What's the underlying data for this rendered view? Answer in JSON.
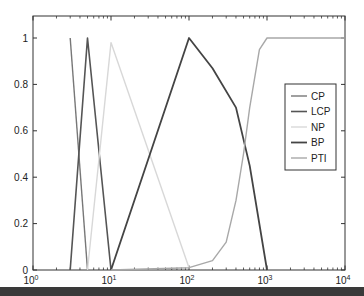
{
  "chart_data": {
    "type": "line",
    "title": "",
    "xlabel": "",
    "ylabel": "",
    "xscale": "log",
    "xlim": [
      1,
      10000
    ],
    "ylim": [
      0,
      1.05
    ],
    "grid": false,
    "legend_position": "right-middle",
    "x_ticks": [
      {
        "exp": 0,
        "label": "10",
        "sup": "0"
      },
      {
        "exp": 1,
        "label": "10",
        "sup": "1"
      },
      {
        "exp": 2,
        "label": "10",
        "sup": "2"
      },
      {
        "exp": 3,
        "label": "10",
        "sup": "3"
      },
      {
        "exp": 4,
        "label": "10",
        "sup": "4"
      }
    ],
    "y_ticks": [
      {
        "value": 0,
        "label": "0"
      },
      {
        "value": 0.2,
        "label": "0.2"
      },
      {
        "value": 0.4,
        "label": "0.4"
      },
      {
        "value": 0.6,
        "label": "0.6"
      },
      {
        "value": 0.8,
        "label": "0.8"
      },
      {
        "value": 1,
        "label": "1"
      }
    ],
    "series": [
      {
        "name": "CP",
        "color": "#777777",
        "width": 1.4,
        "points": [
          [
            3,
            1
          ],
          [
            5,
            0
          ]
        ]
      },
      {
        "name": "LCP",
        "color": "#555555",
        "width": 1.6,
        "points": [
          [
            3,
            0
          ],
          [
            5,
            1
          ],
          [
            10,
            0
          ]
        ]
      },
      {
        "name": "NP",
        "color": "#d8d8d8",
        "width": 1.4,
        "points": [
          [
            5,
            0
          ],
          [
            10,
            0.98
          ],
          [
            100,
            0.01
          ]
        ]
      },
      {
        "name": "BP",
        "color": "#444444",
        "width": 1.8,
        "points": [
          [
            10,
            0
          ],
          [
            100,
            1
          ],
          [
            200,
            0.87
          ],
          [
            400,
            0.7
          ],
          [
            600,
            0.45
          ],
          [
            1000,
            0
          ]
        ]
      },
      {
        "name": "PTI",
        "color": "#a8a8a8",
        "width": 1.4,
        "points": [
          [
            10,
            0
          ],
          [
            100,
            0.01
          ],
          [
            200,
            0.04
          ],
          [
            300,
            0.12
          ],
          [
            400,
            0.3
          ],
          [
            500,
            0.5
          ],
          [
            600,
            0.7
          ],
          [
            800,
            0.95
          ],
          [
            1000,
            1
          ],
          [
            10000,
            1
          ]
        ]
      }
    ]
  }
}
